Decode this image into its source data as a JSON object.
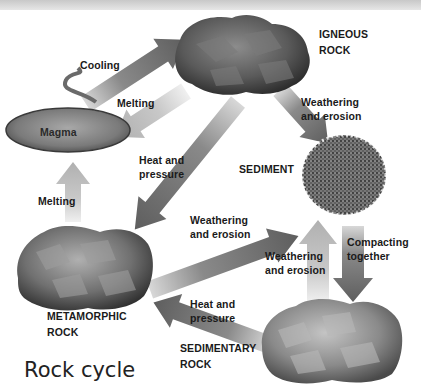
{
  "title": "Rock cycle",
  "nodes": {
    "igneous": "IGNEOUS ROCK",
    "igneous_line1": "IGNEOUS",
    "igneous_line2": "ROCK",
    "magma": "Magma",
    "sediment": "SEDIMENT",
    "metamorphic_line1": "METAMORPHIC",
    "metamorphic_line2": "ROCK",
    "sedimentary_line1": "SEDIMENTARY",
    "sedimentary_line2": "ROCK"
  },
  "arrows": {
    "cooling": "Cooling",
    "melting_igneous": "Melting",
    "melting_metamorphic": "Melting",
    "heat_pressure_igneous_1": "Heat and",
    "heat_pressure_igneous_2": "pressure",
    "weathering_igneous_1": "Weathering",
    "weathering_igneous_2": "and erosion",
    "weathering_metamorphic_1": "Weathering",
    "weathering_metamorphic_2": "and erosion",
    "weathering_sedimentary_1": "Weathering",
    "weathering_sedimentary_2": "and erosion",
    "compacting_1": "Compacting",
    "compacting_2": "together",
    "heat_pressure_sedimentary_1": "Heat and",
    "heat_pressure_sedimentary_2": "pressure"
  },
  "edges": [
    {
      "from": "Magma",
      "to": "Igneous rock",
      "label": "Cooling"
    },
    {
      "from": "Igneous rock",
      "to": "Magma",
      "label": "Melting"
    },
    {
      "from": "Igneous rock",
      "to": "Sediment",
      "label": "Weathering and erosion"
    },
    {
      "from": "Igneous rock",
      "to": "Metamorphic rock",
      "label": "Heat and pressure"
    },
    {
      "from": "Metamorphic rock",
      "to": "Magma",
      "label": "Melting"
    },
    {
      "from": "Metamorphic rock",
      "to": "Sediment",
      "label": "Weathering and erosion"
    },
    {
      "from": "Sedimentary rock",
      "to": "Sediment",
      "label": "Weathering and erosion"
    },
    {
      "from": "Sediment",
      "to": "Sedimentary rock",
      "label": "Compacting together"
    },
    {
      "from": "Sedimentary rock",
      "to": "Metamorphic rock",
      "label": "Heat and pressure"
    }
  ],
  "colors": {
    "arrow_dark": "#6e6e6e",
    "arrow_light": "#c4c4c4",
    "text": "#1a1a1a",
    "magma": "#8a8a8a"
  }
}
